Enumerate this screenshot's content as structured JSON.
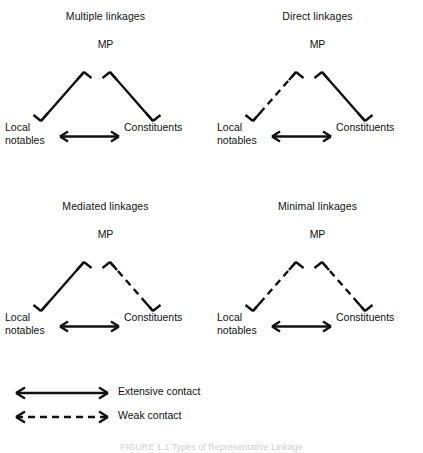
{
  "figure": {
    "caption": "FIGURE 1.1  Types of Representative Linkage",
    "nodes": {
      "mp": "MP",
      "local_line1": "Local",
      "local_line2": "notables",
      "constituents": "Constituents"
    },
    "panels": [
      {
        "id": "multiple-linkages",
        "title": "Multiple linkages",
        "edges": [
          {
            "id": "local-mp",
            "from": "Local notables",
            "to": "MP",
            "style": "solid",
            "contact": "Extensive contact"
          },
          {
            "id": "mp-const",
            "from": "MP",
            "to": "Constituents",
            "style": "solid",
            "contact": "Extensive contact"
          },
          {
            "id": "local-const",
            "from": "Local notables",
            "to": "Constituents",
            "style": "solid",
            "contact": "Extensive contact"
          }
        ]
      },
      {
        "id": "direct-linkages",
        "title": "Direct linkages",
        "edges": [
          {
            "id": "local-mp",
            "from": "Local notables",
            "to": "MP",
            "style": "dashed",
            "contact": "Weak contact"
          },
          {
            "id": "mp-const",
            "from": "MP",
            "to": "Constituents",
            "style": "solid",
            "contact": "Extensive contact"
          },
          {
            "id": "local-const",
            "from": "Local notables",
            "to": "Constituents",
            "style": "solid",
            "contact": "Extensive contact"
          }
        ]
      },
      {
        "id": "mediated-linkages",
        "title": "Mediated linkages",
        "edges": [
          {
            "id": "local-mp",
            "from": "Local notables",
            "to": "MP",
            "style": "solid",
            "contact": "Extensive contact"
          },
          {
            "id": "mp-const",
            "from": "MP",
            "to": "Constituents",
            "style": "dashed",
            "contact": "Weak contact"
          },
          {
            "id": "local-const",
            "from": "Local notables",
            "to": "Constituents",
            "style": "solid",
            "contact": "Extensive contact"
          }
        ]
      },
      {
        "id": "minimal-linkages",
        "title": "Minimal linkages",
        "edges": [
          {
            "id": "local-mp",
            "from": "Local notables",
            "to": "MP",
            "style": "dashed",
            "contact": "Weak contact"
          },
          {
            "id": "mp-const",
            "from": "MP",
            "to": "Constituents",
            "style": "dashed",
            "contact": "Weak contact"
          },
          {
            "id": "local-const",
            "from": "Local notables",
            "to": "Constituents",
            "style": "solid",
            "contact": "Extensive contact"
          }
        ]
      }
    ],
    "legend": [
      {
        "id": "extensive-contact",
        "label": "Extensive contact",
        "style": "solid"
      },
      {
        "id": "weak-contact",
        "label": "Weak contact",
        "style": "dashed"
      }
    ],
    "colors": {
      "ink": "#111111",
      "background": "#ffffff"
    }
  }
}
